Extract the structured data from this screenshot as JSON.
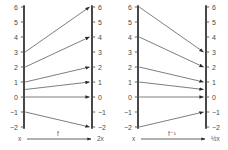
{
  "figure": {
    "background": "#ffffff",
    "axis_color": "#1a1a1a",
    "mapline_color": "#6f6f6f",
    "label_color": "#4a4a4a"
  },
  "panels": [
    {
      "id": "left",
      "map_label": "f",
      "domain_label": "x",
      "range_label": "2x",
      "left_axis": {
        "name": "domain-axis",
        "ticks": [
          "6",
          "5",
          "4",
          "3",
          "2",
          "1",
          "0",
          "−1",
          "−2"
        ],
        "values": [
          6,
          5,
          4,
          3,
          2,
          1,
          0,
          -1,
          -2
        ]
      },
      "right_axis": {
        "name": "range-axis",
        "ticks": [
          "6",
          "5",
          "4",
          "3",
          "2",
          "1",
          "0",
          "−1",
          "−2"
        ],
        "values": [
          6,
          5,
          4,
          3,
          2,
          1,
          0,
          -1,
          -2
        ]
      },
      "mappings": [
        {
          "from": 3,
          "to": 6,
          "from_label": "3",
          "to_label": "6"
        },
        {
          "from": 2,
          "to": 4,
          "from_label": "2",
          "to_label": "4"
        },
        {
          "from": 1,
          "to": 2,
          "from_label": "1",
          "to_label": "2"
        },
        {
          "from": 0.5,
          "to": 1,
          "from_label": "0.5",
          "to_label": "1"
        },
        {
          "from": 0,
          "to": 0,
          "from_label": "0",
          "to_label": "0"
        },
        {
          "from": -1,
          "to": -2,
          "from_label": "−1",
          "to_label": "−2"
        }
      ]
    },
    {
      "id": "right",
      "map_label": "f⁻¹",
      "domain_label": "x",
      "range_label": "½x",
      "left_axis": {
        "name": "domain-axis",
        "ticks": [
          "6",
          "5",
          "4",
          "3",
          "2",
          "1",
          "0",
          "−1",
          "−2"
        ],
        "values": [
          6,
          5,
          4,
          3,
          2,
          1,
          0,
          -1,
          -2
        ]
      },
      "right_axis": {
        "name": "range-axis",
        "ticks": [
          "6",
          "5",
          "4",
          "3",
          "2",
          "1",
          "0",
          "−1",
          "−2"
        ],
        "values": [
          6,
          5,
          4,
          3,
          2,
          1,
          0,
          -1,
          -2
        ]
      },
      "mappings": [
        {
          "from": 6,
          "to": 3,
          "from_label": "6",
          "to_label": "3"
        },
        {
          "from": 4,
          "to": 2,
          "from_label": "4",
          "to_label": "2"
        },
        {
          "from": 2,
          "to": 1,
          "from_label": "2",
          "to_label": "1"
        },
        {
          "from": 1,
          "to": 0.5,
          "from_label": "1",
          "to_label": "0.5"
        },
        {
          "from": 0,
          "to": 0,
          "from_label": "0",
          "to_label": "0"
        },
        {
          "from": -2,
          "to": -1,
          "from_label": "−2",
          "to_label": "−1"
        }
      ]
    }
  ]
}
